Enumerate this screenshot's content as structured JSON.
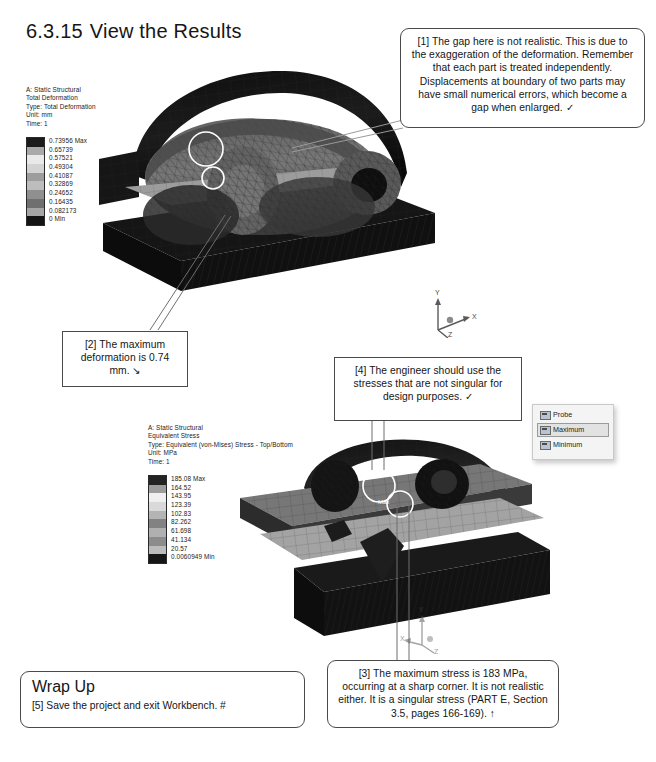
{
  "page": {
    "heading_number": "6.3.15",
    "heading_text": "View the Results"
  },
  "deformation_legend": {
    "line1": "A: Static Structural",
    "line2": "Total Deformation",
    "line3": "Type: Total Deformation",
    "line4": "Unit: mm",
    "line5": "Time: 1",
    "labels": [
      "0.73956 Max",
      "0.65739",
      "0.57521",
      "0.49304",
      "0.41087",
      "0.32869",
      "0.24652",
      "0.16435",
      "0.082173",
      "0 Min"
    ],
    "colors": [
      "#1b1b1b",
      "#a9a9a9",
      "#e9e9e9",
      "#d3d3d3",
      "#9d9d9d",
      "#bdbdbd",
      "#8f8f8f",
      "#6f6f6f",
      "#a5a5a5",
      "#141414"
    ]
  },
  "stress_legend": {
    "line1": "A: Static Structural",
    "line2": "Equivalent Stress",
    "line3": "Type: Equivalent (von-Mises) Stress - Top/Bottom",
    "line4": "Unit: MPa",
    "line5": "Time: 1",
    "labels": [
      "185.08 Max",
      "164.52",
      "143.95",
      "123.39",
      "102.83",
      "82.262",
      "61.698",
      "41.134",
      "20.57",
      "0.0060949 Min"
    ],
    "colors": [
      "#232323",
      "#9c9c9c",
      "#efefef",
      "#d9d9d9",
      "#b4b4b4",
      "#828282",
      "#b0b0b0",
      "#8c8c8c",
      "#bcbcbc",
      "#161616"
    ]
  },
  "callouts": {
    "one": "[1] The gap here is not realistic.  This is due to the exaggeration of the deformation.  Remember that each part is treated independently.  Displacements at boundary of two parts may have small numerical errors, which become a gap when enlarged.  ✓",
    "two": "[2] The maximum deformation is 0.74 mm.  ↘",
    "four": "[4] The engineer should use the stresses that are not singular for design purposes.  ✓",
    "three": "[3] The maximum stress is 183 MPa, occurring at a sharp corner.  It is not realistic either.  It is a singular stress (PART E, Section 3.5, pages 166-169).  ↑"
  },
  "wrap_up": {
    "title": "Wrap Up",
    "body": "[5] Save the project and exit Workbench.  #"
  },
  "result_toolbar": {
    "items": [
      {
        "label": "Probe",
        "selected": false
      },
      {
        "label": "Maximum",
        "selected": true
      },
      {
        "label": "Minimum",
        "selected": false
      }
    ]
  },
  "triads": {
    "axis_x": "X",
    "axis_y": "Y",
    "axis_z": "Z"
  },
  "viewport_labels": {
    "max_marker": "Max"
  }
}
